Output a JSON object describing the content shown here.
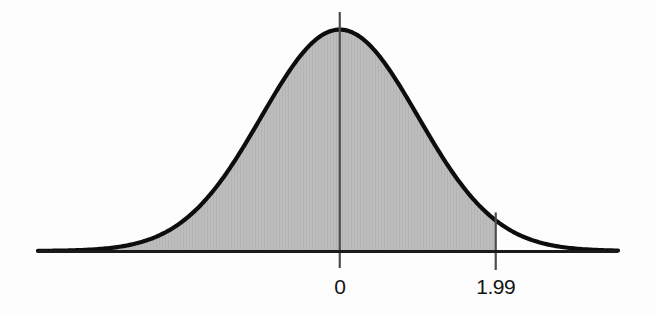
{
  "figure": {
    "name": "standard-normal-curve-with-critical-value",
    "background_color": "#fdfdfd",
    "curve_color": "#0d0d0d",
    "shade_color": "#bcbcbc",
    "axis_color": "#1a1a1a",
    "gridline_color": "#555555"
  },
  "labels": {
    "zero": "0",
    "critical": "1.99"
  },
  "chart_data": {
    "type": "area",
    "title": "",
    "subtitle": "",
    "xlabel": "",
    "ylabel": "",
    "grid": false,
    "legend": null,
    "distribution": "standard normal (z)",
    "mean": 0,
    "sd": 1,
    "xlim": [
      -3.85,
      3.55
    ],
    "ylim": [
      0,
      0.42
    ],
    "tick_values": [
      0,
      1.99
    ],
    "tick_labels": [
      "0",
      "1.99"
    ],
    "annotations": [
      {
        "name": "center-line",
        "x": 0,
        "label": "0",
        "type": "vertical-line"
      },
      {
        "name": "critical-value-line",
        "x": 1.99,
        "label": "1.99",
        "type": "vertical-line"
      }
    ],
    "shaded_region": {
      "from": -3.85,
      "to": 1.99,
      "description": "area under the standard normal curve to the left of z = 1.99",
      "fill": "#bcbcbc"
    },
    "x": [
      -3.85,
      -3.6,
      -3.4,
      -3.2,
      -3.0,
      -2.8,
      -2.6,
      -2.4,
      -2.2,
      -2.0,
      -1.8,
      -1.6,
      -1.4,
      -1.2,
      -1.0,
      -0.8,
      -0.6,
      -0.4,
      -0.2,
      0.0,
      0.2,
      0.4,
      0.6,
      0.8,
      1.0,
      1.2,
      1.4,
      1.6,
      1.8,
      1.99,
      2.2,
      2.4,
      2.6,
      2.8,
      3.0,
      3.2,
      3.4,
      3.55
    ],
    "y": [
      0.0003,
      0.0006,
      0.0012,
      0.0024,
      0.0044,
      0.0079,
      0.0136,
      0.0224,
      0.0355,
      0.054,
      0.079,
      0.1109,
      0.1497,
      0.1942,
      0.242,
      0.2897,
      0.3332,
      0.3683,
      0.391,
      0.3989,
      0.391,
      0.3683,
      0.3332,
      0.2897,
      0.242,
      0.1942,
      0.1497,
      0.1109,
      0.079,
      0.0551,
      0.0355,
      0.0224,
      0.0136,
      0.0079,
      0.0044,
      0.0024,
      0.0012,
      0.0007
    ]
  }
}
